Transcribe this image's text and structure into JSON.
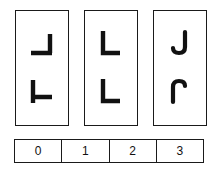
{
  "task": {
    "type": "visual-rotation-matching",
    "panel_count": 3,
    "glyphs_per_panel": 2
  },
  "panels": [
    {
      "index": 0,
      "name": "panel-1",
      "glyphs": [
        {
          "slot": "top",
          "symbol": "L",
          "icon": "l-shape-rotated-180-icon",
          "rotation_degrees": 180,
          "style": "angular"
        },
        {
          "slot": "bottom",
          "symbol": "L",
          "icon": "l-shape-rotated-90-icon",
          "rotation_degrees": 90,
          "style": "angular"
        }
      ]
    },
    {
      "index": 1,
      "name": "panel-2",
      "glyphs": [
        {
          "slot": "top",
          "symbol": "L",
          "icon": "l-shape-icon",
          "rotation_degrees": 0,
          "style": "angular"
        },
        {
          "slot": "bottom",
          "symbol": "L",
          "icon": "l-shape-icon",
          "rotation_degrees": 0,
          "style": "angular"
        }
      ]
    },
    {
      "index": 2,
      "name": "panel-3",
      "glyphs": [
        {
          "slot": "top",
          "symbol": "J",
          "icon": "j-shape-icon",
          "rotation_degrees": 0,
          "style": "hooked"
        },
        {
          "slot": "bottom",
          "symbol": "J",
          "icon": "j-shape-rotated-180-icon",
          "rotation_degrees": 180,
          "style": "hooked"
        }
      ]
    }
  ],
  "index_bar": {
    "name": "answer-index-bar",
    "cells": [
      {
        "label": "0",
        "value": 0
      },
      {
        "label": "1",
        "value": 1
      },
      {
        "label": "2",
        "value": 2
      },
      {
        "label": "3",
        "value": 3
      }
    ]
  },
  "colors": {
    "stroke": "#111111",
    "border": "#1a1a1a",
    "background": "#ffffff"
  }
}
